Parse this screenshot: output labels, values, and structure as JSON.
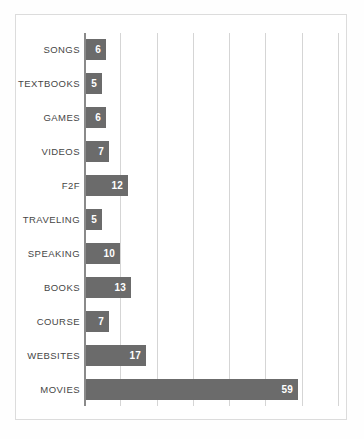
{
  "chart_data": {
    "type": "bar",
    "orientation": "horizontal",
    "title": "",
    "subtitle": "",
    "xlabel": "",
    "ylabel": "",
    "categories": [
      "SONGS",
      "TEXTBOOKS",
      "GAMES",
      "VIDEOS",
      "F2F",
      "TRAVELING",
      "SPEAKING",
      "BOOKS",
      "COURSE",
      "WEBSITES",
      "MOVIES"
    ],
    "values": [
      6,
      5,
      6,
      7,
      12,
      5,
      10,
      13,
      7,
      17,
      59
    ],
    "data_labels": [
      "6",
      "5",
      "6",
      "7",
      "12",
      "5",
      "10",
      "13",
      "7",
      "17",
      "59"
    ],
    "xlim": [
      0,
      70
    ],
    "gridlines": [
      0,
      10,
      20,
      30,
      40,
      50,
      60,
      70
    ],
    "tick_labels_visible": false,
    "grid": "vertical",
    "legend": "none",
    "bar_color": "#6b6b6b",
    "gridline_color": "#d5d5d5",
    "axis_color": "#8a8a8a",
    "frame_color": "#dcdcdc",
    "label_color": "#464646",
    "value_label_color": "#ffffff",
    "background_color": "#ffffff"
  }
}
